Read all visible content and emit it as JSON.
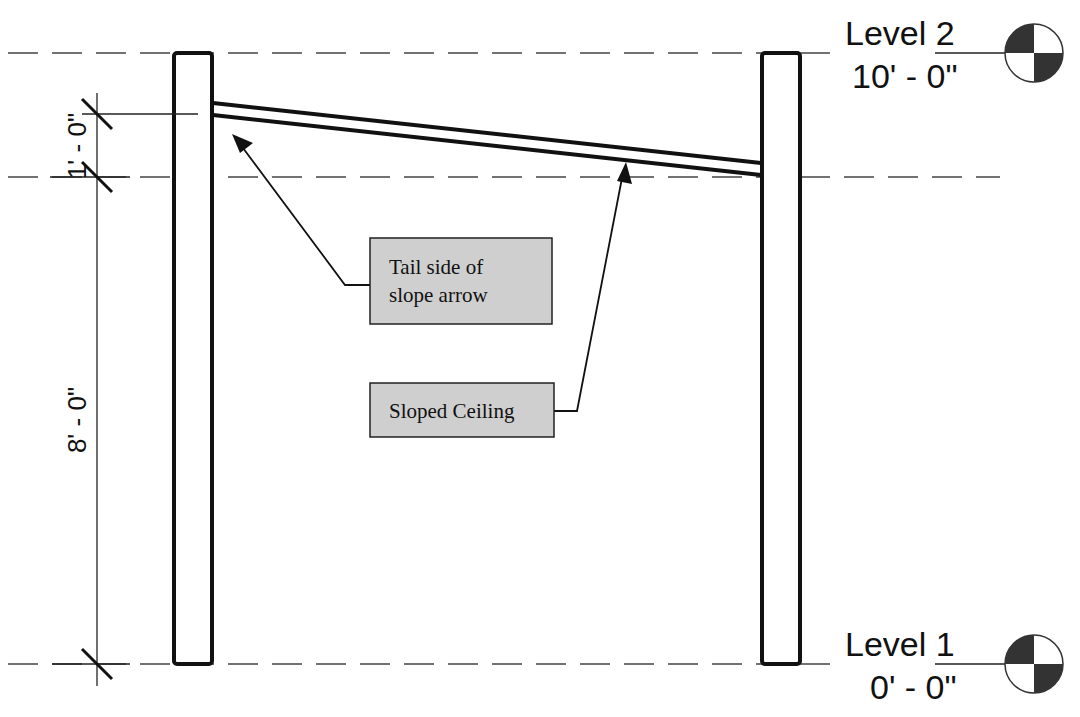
{
  "diagram": {
    "type": "section-elevation",
    "levels": [
      {
        "name": "Level 2",
        "elevation": "10' - 0\"",
        "y": 53
      },
      {
        "name": "Level 1",
        "elevation": "0' - 0\"",
        "y": 664
      }
    ],
    "dimensions": [
      {
        "label": "1' - 0\"",
        "orientation": "vertical"
      },
      {
        "label": "8' - 0\"",
        "orientation": "vertical"
      }
    ],
    "callouts": [
      {
        "id": "tail",
        "lines": [
          "Tail side of",
          "slope arrow"
        ]
      },
      {
        "id": "ceiling",
        "lines": [
          "Sloped Ceiling"
        ]
      }
    ],
    "colors": {
      "line": "#111111",
      "callout_fill": "#cfcfcf",
      "background": "#ffffff"
    }
  }
}
